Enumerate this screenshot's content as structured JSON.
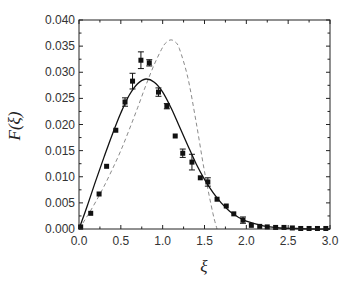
{
  "chart_data": {
    "type": "scatter",
    "title": "",
    "xlabel": "ξ",
    "ylabel": "F(ξ)",
    "xlim": [
      0.0,
      3.0
    ],
    "ylim": [
      0.0,
      0.04
    ],
    "x_ticks": [
      "0.0",
      "0.5",
      "1.0",
      "1.5",
      "2.0",
      "2.5",
      "3.0"
    ],
    "y_ticks": [
      "0.000",
      "0.005",
      "0.010",
      "0.015",
      "0.020",
      "0.025",
      "0.030",
      "0.035",
      "0.040"
    ],
    "grid": false,
    "legend": null,
    "series": [
      {
        "name": "data",
        "style": "black square markers with error bars",
        "x": [
          0.02,
          0.14,
          0.24,
          0.33,
          0.44,
          0.55,
          0.64,
          0.74,
          0.84,
          0.95,
          1.05,
          1.15,
          1.24,
          1.35,
          1.45,
          1.54,
          1.65,
          1.76,
          1.85,
          1.96,
          2.06,
          2.16,
          2.25,
          2.35,
          2.45,
          2.55,
          2.65,
          2.75,
          2.85,
          2.95
        ],
        "y": [
          0.0004,
          0.003,
          0.0067,
          0.012,
          0.0189,
          0.0243,
          0.0283,
          0.0323,
          0.0318,
          0.0262,
          0.0235,
          0.0178,
          0.0145,
          0.0128,
          0.0098,
          0.009,
          0.0057,
          0.0044,
          0.0029,
          0.0017,
          0.0007,
          0.0005,
          0.0004,
          0.0003,
          0.0003,
          0.0002,
          0.0001,
          0.0001,
          0.0001,
          0.0001
        ],
        "yerr": [
          0.0002,
          0.0003,
          0.0003,
          0.0003,
          0.0004,
          0.0008,
          0.0015,
          0.0016,
          0.0006,
          0.0008,
          0.0005,
          0.0004,
          0.0008,
          0.0015,
          0.0004,
          0.0008,
          0.0003,
          0.0003,
          0.0004,
          0.0006,
          0.0004,
          0.0002,
          0.0002,
          0.0002,
          0.0002,
          0.0001,
          0.0001,
          0.0001,
          0.0001,
          0.0001
        ]
      },
      {
        "name": "fit (solid)",
        "style": "solid black line",
        "x": [
          0.0,
          0.1,
          0.2,
          0.3,
          0.4,
          0.5,
          0.6,
          0.7,
          0.8,
          0.9,
          1.0,
          1.1,
          1.2,
          1.3,
          1.4,
          1.5,
          1.6,
          1.7,
          1.8,
          1.9,
          2.0,
          2.2,
          2.4,
          2.6,
          2.8,
          3.0
        ],
        "y": [
          0.0,
          0.0045,
          0.0092,
          0.0138,
          0.0182,
          0.0222,
          0.0256,
          0.0278,
          0.0287,
          0.0281,
          0.0262,
          0.0232,
          0.0196,
          0.016,
          0.0125,
          0.0095,
          0.007,
          0.005,
          0.0034,
          0.0023,
          0.0015,
          0.0006,
          0.0002,
          0.0001,
          0.0,
          0.0
        ]
      },
      {
        "name": "model (dashed)",
        "style": "dashed gray line",
        "x": [
          0.0,
          0.1,
          0.2,
          0.3,
          0.4,
          0.5,
          0.6,
          0.7,
          0.8,
          0.9,
          1.0,
          1.05,
          1.1,
          1.15,
          1.2,
          1.3,
          1.4,
          1.5,
          1.6,
          1.65
        ],
        "y": [
          0.0,
          0.0025,
          0.0052,
          0.0082,
          0.0115,
          0.015,
          0.019,
          0.0232,
          0.0275,
          0.0315,
          0.0348,
          0.0358,
          0.0362,
          0.0358,
          0.0345,
          0.029,
          0.0205,
          0.011,
          0.003,
          0.0
        ]
      }
    ]
  }
}
